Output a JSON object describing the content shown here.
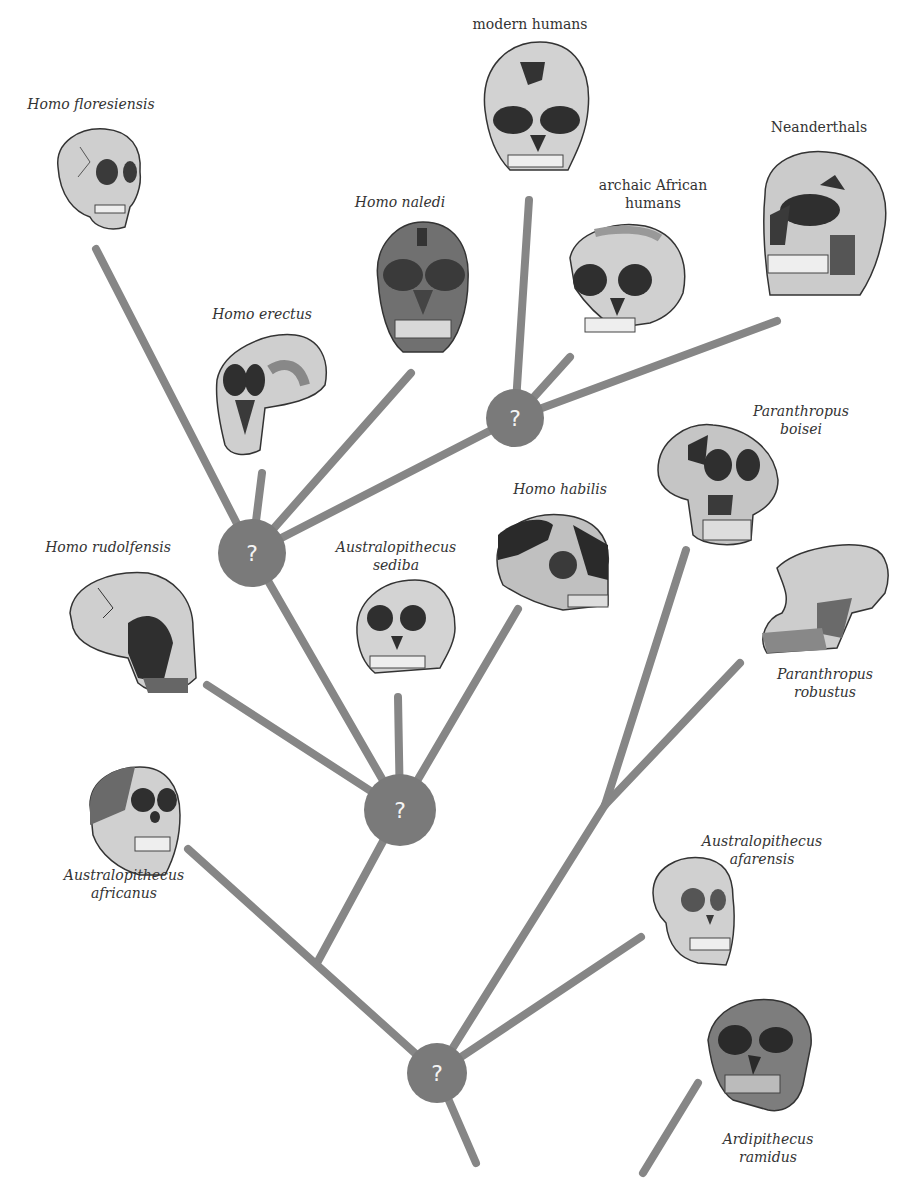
{
  "diagram": {
    "title": "",
    "colors": {
      "branch": "#868686",
      "node": "#7a7a7a",
      "node_text": "#ffffff",
      "label": "#333333"
    },
    "node_symbol": "?",
    "nodes": [
      {
        "id": "N1",
        "x": 252,
        "y": 553,
        "r": 34,
        "label": "?"
      },
      {
        "id": "N2",
        "x": 515,
        "y": 418,
        "r": 29,
        "label": "?"
      },
      {
        "id": "N3",
        "x": 400,
        "y": 810,
        "r": 36,
        "label": "?"
      },
      {
        "id": "N4",
        "x": 437,
        "y": 1073,
        "r": 30,
        "label": "?"
      }
    ],
    "species": [
      {
        "key": "floresiensis",
        "line1": "Homo floresiensis",
        "line2": "",
        "italic": true
      },
      {
        "key": "modern",
        "line1": "modern humans",
        "line2": "",
        "italic": false
      },
      {
        "key": "neanderthals",
        "line1": "Neanderthals",
        "line2": "",
        "italic": false
      },
      {
        "key": "naledi",
        "line1": "Homo naledi",
        "line2": "",
        "italic": true
      },
      {
        "key": "archaic",
        "line1": "archaic African",
        "line2": "humans",
        "italic": false
      },
      {
        "key": "erectus",
        "line1": "Homo erectus",
        "line2": "",
        "italic": true
      },
      {
        "key": "boisei",
        "line1": "Paranthropus",
        "line2": "boisei",
        "italic": true
      },
      {
        "key": "habilis",
        "line1": "Homo habilis",
        "line2": "",
        "italic": true
      },
      {
        "key": "rudolfensis",
        "line1": "Homo rudolfensis",
        "line2": "",
        "italic": true
      },
      {
        "key": "sediba",
        "line1": "Australopithecus",
        "line2": "sediba",
        "italic": true
      },
      {
        "key": "robustus",
        "line1": "Paranthropus",
        "line2": "robustus",
        "italic": true
      },
      {
        "key": "africanus",
        "line1": "Australopithecus",
        "line2": "africanus",
        "italic": true
      },
      {
        "key": "afarensis",
        "line1": "Australopithecus",
        "line2": "afarensis",
        "italic": true
      },
      {
        "key": "ramidus",
        "line1": "Ardipithecus",
        "line2": "ramidus",
        "italic": true
      }
    ]
  }
}
